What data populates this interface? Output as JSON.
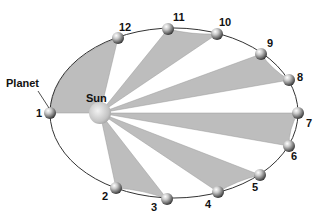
{
  "diagram": {
    "orbit": {
      "cx": 174,
      "cy": 113,
      "rx": 124,
      "ry": 85,
      "stroke": "#333333"
    },
    "sun": {
      "label": "Sun",
      "cx": 100,
      "cy": 113,
      "r": 11,
      "label_x": 86,
      "label_y": 102
    },
    "planet_label": {
      "text": "Planet",
      "x": 6,
      "y": 87,
      "leader": [
        38,
        91,
        49,
        108
      ]
    },
    "sector_fill": "#bdbdbd",
    "shaded_sectors": [
      [
        12,
        1
      ],
      [
        11,
        10
      ],
      [
        9,
        8
      ],
      [
        7,
        6
      ],
      [
        5,
        4
      ],
      [
        3,
        2
      ]
    ],
    "positions": [
      {
        "n": "1",
        "x": 50,
        "y": 113,
        "lx": 36,
        "ly": 117
      },
      {
        "n": "2",
        "x": 116,
        "y": 188,
        "lx": 102,
        "ly": 200
      },
      {
        "n": "3",
        "x": 167,
        "y": 199,
        "lx": 151,
        "ly": 211
      },
      {
        "n": "4",
        "x": 218,
        "y": 192,
        "lx": 205,
        "ly": 208
      },
      {
        "n": "5",
        "x": 260,
        "y": 175,
        "lx": 252,
        "ly": 191
      },
      {
        "n": "6",
        "x": 289,
        "y": 146,
        "lx": 291,
        "ly": 160
      },
      {
        "n": "7",
        "x": 298,
        "y": 113,
        "lx": 306,
        "ly": 127
      },
      {
        "n": "8",
        "x": 289,
        "y": 80,
        "lx": 297,
        "ly": 81
      },
      {
        "n": "9",
        "x": 261,
        "y": 54,
        "lx": 267,
        "ly": 47
      },
      {
        "n": "10",
        "x": 217,
        "y": 34,
        "lx": 219,
        "ly": 26
      },
      {
        "n": "11",
        "x": 168,
        "y": 29,
        "lx": 173,
        "ly": 21
      },
      {
        "n": "12",
        "x": 118,
        "y": 38,
        "lx": 119,
        "ly": 31
      }
    ]
  }
}
